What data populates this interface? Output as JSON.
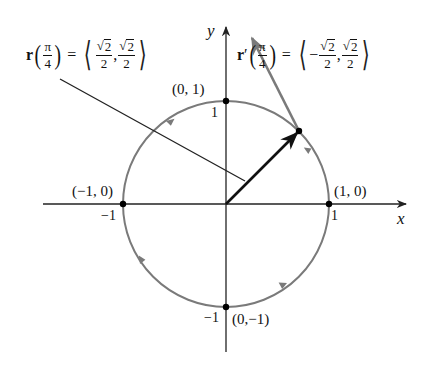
{
  "diagram": {
    "type": "unit-circle-parametric",
    "colors": {
      "axes": "#222222",
      "circle": "#7a7a7a",
      "position_vector": "#111111",
      "tangent_vector": "#7a7a7a",
      "leader_line": "#222222",
      "points": "#000000"
    },
    "axes": {
      "x_label": "x",
      "y_label": "y",
      "x_tick_pos": "1",
      "x_tick_neg": "−1",
      "y_tick_pos": "1",
      "y_tick_neg": "−1"
    },
    "points": [
      {
        "name": "east",
        "label": "(1, 0)"
      },
      {
        "name": "north",
        "label": "(0, 1)"
      },
      {
        "name": "west",
        "label": "(−1, 0)"
      },
      {
        "name": "south",
        "label": "(0,−1)"
      }
    ],
    "position_equation": {
      "func": "r",
      "arg_num": "π",
      "arg_den": "4",
      "equals": "=",
      "open": "⟨",
      "close": "⟩",
      "c1_sign": "",
      "c1_num": "2",
      "c1_den": "2",
      "comma": ",",
      "c2_num": "2",
      "c2_den": "2",
      "radical": "√"
    },
    "tangent_equation": {
      "func": "r",
      "prime": "′",
      "arg_num": "π",
      "arg_den": "4",
      "equals": "=",
      "open": "⟨",
      "close": "⟩",
      "c1_sign": "−",
      "c1_num": "2",
      "c1_den": "2",
      "comma": ",",
      "c2_num": "2",
      "c2_den": "2",
      "radical": "√"
    }
  }
}
